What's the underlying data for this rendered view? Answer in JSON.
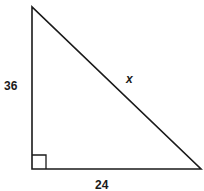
{
  "diagram": {
    "type": "right-triangle",
    "labels": {
      "vertical_leg": "36",
      "hypotenuse": "x",
      "horizontal_leg": "24"
    },
    "right_angle_marker": "bottom-left",
    "colors": {
      "stroke": "#1a1a1a",
      "background": "#ffffff"
    }
  }
}
